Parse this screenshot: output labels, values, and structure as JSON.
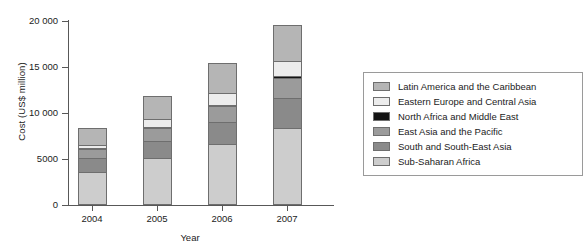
{
  "chart_data": {
    "type": "bar",
    "subtype": "stacked-bar",
    "title": "",
    "xlabel": "Year",
    "ylabel": "Cost (US$ million)",
    "categories": [
      "2004",
      "2005",
      "2006",
      "2007"
    ],
    "ylim": [
      0,
      20000
    ],
    "yticks": [
      0,
      5000,
      10000,
      15000,
      20000
    ],
    "ytick_labels": [
      "0",
      "5000",
      "10 000",
      "15 000",
      "20 000"
    ],
    "grid": false,
    "legend_position": "right",
    "stack_order_bottom_to_top": [
      "Sub-Saharan Africa",
      "South and South-East Asia",
      "East Asia and the Pacific",
      "North Africa and Middle East",
      "Eastern Europe and Central Asia",
      "Latin America and the Caribbean"
    ],
    "series": [
      {
        "name": "Latin America and the Caribbean",
        "color": "#b5b5b5",
        "values": [
          1900,
          2500,
          3300,
          4000
        ]
      },
      {
        "name": "Eastern Europe and Central Asia",
        "color": "#ececec",
        "values": [
          400,
          900,
          1300,
          1600
        ]
      },
      {
        "name": "North Africa and Middle East",
        "color": "#141414",
        "values": [
          100,
          100,
          100,
          300
        ]
      },
      {
        "name": "East Asia and the Pacific",
        "color": "#9b9b9b",
        "values": [
          1000,
          1400,
          1800,
          2200
        ]
      },
      {
        "name": "South and South-East Asia",
        "color": "#8a8a8a",
        "values": [
          1500,
          1900,
          2400,
          3300
        ]
      },
      {
        "name": "Sub-Saharan Africa",
        "color": "#cdcdcd",
        "values": [
          3500,
          5000,
          6500,
          8200
        ]
      }
    ],
    "totals": [
      8400,
      11800,
      15400,
      19600
    ]
  },
  "legend": {
    "items": [
      {
        "label": "Latin America and the Caribbean",
        "color": "#b5b5b5"
      },
      {
        "label": "Eastern Europe and Central Asia",
        "color": "#ececec"
      },
      {
        "label": "North Africa and Middle East",
        "color": "#141414"
      },
      {
        "label": "East Asia and the Pacific",
        "color": "#9b9b9b"
      },
      {
        "label": "South and South-East Asia",
        "color": "#8a8a8a"
      },
      {
        "label": "Sub-Saharan Africa",
        "color": "#cdcdcd"
      }
    ]
  }
}
